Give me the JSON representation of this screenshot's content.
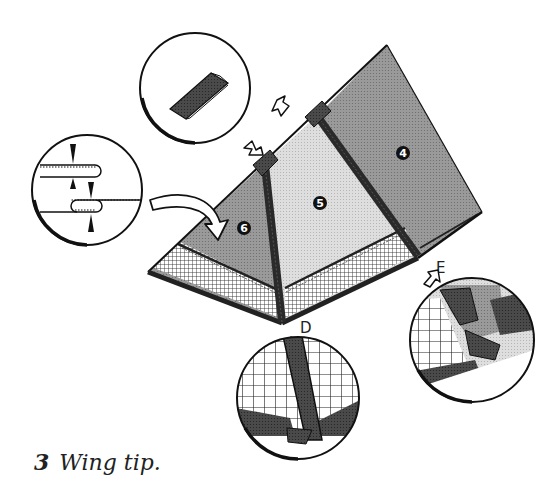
{
  "caption": {
    "number": "3",
    "text": "Wing tip."
  },
  "panels": [
    {
      "id": "panel-4",
      "label": "4",
      "fill": "#9a9a9a"
    },
    {
      "id": "panel-5",
      "label": "5",
      "fill": "#d8d8d8"
    },
    {
      "id": "panel-6",
      "label": "6",
      "fill": "#a4a4a4"
    }
  ],
  "points": {
    "d_label": "D",
    "e_label": "E"
  },
  "details": [
    {
      "id": "detail-spar-cap",
      "description": "Spar end cap pocket"
    },
    {
      "id": "detail-hem-fold",
      "description": "Hem fold with stitching lines"
    },
    {
      "id": "detail-d",
      "description": "Close-up of junction D"
    },
    {
      "id": "detail-e",
      "description": "Close-up of junction E"
    }
  ],
  "colors": {
    "ink": "#1a1a1a",
    "dark_fabric": "#3a3a3a",
    "mid_fabric": "#9a9a9a",
    "light_fabric": "#d8d8d8",
    "mesh_bg": "#ffffff"
  }
}
